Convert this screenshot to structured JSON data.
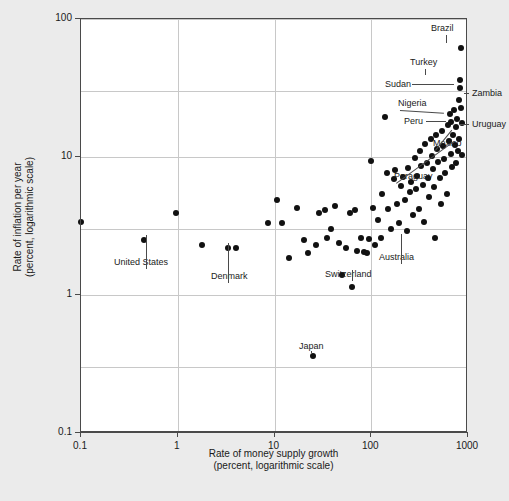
{
  "chart_data": {
    "type": "scatter",
    "title": "",
    "xlabel": "Rate of money supply growth\n(percent, logarithmic scale)",
    "xlabel_line1": "Rate of money supply growth",
    "xlabel_line2": "(percent, logarithmic scale)",
    "ylabel_line1": "Rate of inflation per year",
    "ylabel_line2": "(percent, logarithmic scale)",
    "xscale": "log",
    "yscale": "log",
    "xlim": [
      0.1,
      1000
    ],
    "ylim": [
      0.1,
      100
    ],
    "xticks": [
      "0.1",
      "1",
      "10",
      "100",
      "1000"
    ],
    "yticks": [
      "0.1",
      "1",
      "10",
      "100"
    ],
    "grid": true,
    "legend": "none",
    "marker_color": "#111111",
    "background_color": "#ebebeb",
    "plot_background_color": "#ffffff",
    "points": [
      {
        "x": 0.1,
        "y": 3.4
      },
      {
        "x": 0.45,
        "y": 2.5,
        "label": "United States"
      },
      {
        "x": 0.95,
        "y": 3.9
      },
      {
        "x": 1.8,
        "y": 2.3
      },
      {
        "x": 3.3,
        "y": 2.2
      },
      {
        "x": 4.0,
        "y": 2.2,
        "label": "Denmark"
      },
      {
        "x": 8.5,
        "y": 3.3
      },
      {
        "x": 10.5,
        "y": 4.9
      },
      {
        "x": 12.0,
        "y": 3.3
      },
      {
        "x": 14.0,
        "y": 1.85
      },
      {
        "x": 17.0,
        "y": 4.3
      },
      {
        "x": 20.0,
        "y": 2.5
      },
      {
        "x": 22.0,
        "y": 2.0
      },
      {
        "x": 25.0,
        "y": 0.36,
        "label": "Japan"
      },
      {
        "x": 27.0,
        "y": 2.3
      },
      {
        "x": 29.0,
        "y": 3.9
      },
      {
        "x": 33.0,
        "y": 4.1
      },
      {
        "x": 35.0,
        "y": 2.6
      },
      {
        "x": 38.0,
        "y": 3.0
      },
      {
        "x": 42.0,
        "y": 4.4
      },
      {
        "x": 46.0,
        "y": 2.4
      },
      {
        "x": 50.0,
        "y": 1.4,
        "label": "Switzerland"
      },
      {
        "x": 55.0,
        "y": 2.2
      },
      {
        "x": 60.0,
        "y": 3.9
      },
      {
        "x": 63.0,
        "y": 1.15
      },
      {
        "x": 68.0,
        "y": 4.1
      },
      {
        "x": 72.0,
        "y": 2.1
      },
      {
        "x": 78.0,
        "y": 2.6
      },
      {
        "x": 85.0,
        "y": 2.05
      },
      {
        "x": 90.0,
        "y": 2.0
      },
      {
        "x": 95.0,
        "y": 2.55,
        "label": "Australia"
      },
      {
        "x": 100.0,
        "y": 9.3
      },
      {
        "x": 105.0,
        "y": 4.3
      },
      {
        "x": 110.0,
        "y": 2.3
      },
      {
        "x": 118.0,
        "y": 3.5
      },
      {
        "x": 125.0,
        "y": 2.6
      },
      {
        "x": 130.0,
        "y": 5.4
      },
      {
        "x": 140.0,
        "y": 19.5
      },
      {
        "x": 145.0,
        "y": 7.6
      },
      {
        "x": 150.0,
        "y": 4.2
      },
      {
        "x": 160.0,
        "y": 3.0
      },
      {
        "x": 170.0,
        "y": 6.9
      },
      {
        "x": 175.0,
        "y": 8.0
      },
      {
        "x": 185.0,
        "y": 4.6
      },
      {
        "x": 195.0,
        "y": 3.3
      },
      {
        "x": 205.0,
        "y": 6.2
      },
      {
        "x": 215.0,
        "y": 7.2
      },
      {
        "x": 225.0,
        "y": 4.9
      },
      {
        "x": 235.0,
        "y": 2.9
      },
      {
        "x": 240.0,
        "y": 8.3
      },
      {
        "x": 250.0,
        "y": 5.6
      },
      {
        "x": 260.0,
        "y": 6.6
      },
      {
        "x": 270.0,
        "y": 3.8
      },
      {
        "x": 280.0,
        "y": 9.8
      },
      {
        "x": 290.0,
        "y": 5.9
      },
      {
        "x": 300.0,
        "y": 7.3
      },
      {
        "x": 310.0,
        "y": 4.2
      },
      {
        "x": 320.0,
        "y": 11.0
      },
      {
        "x": 330.0,
        "y": 8.6
      },
      {
        "x": 340.0,
        "y": 6.3
      },
      {
        "x": 350.0,
        "y": 3.4
      },
      {
        "x": 360.0,
        "y": 12.5
      },
      {
        "x": 375.0,
        "y": 9.1
      },
      {
        "x": 385.0,
        "y": 7.0
      },
      {
        "x": 395.0,
        "y": 5.1
      },
      {
        "x": 410.0,
        "y": 13.5
      },
      {
        "x": 420.0,
        "y": 10.2
      },
      {
        "x": 435.0,
        "y": 8.2
      },
      {
        "x": 445.0,
        "y": 6.1
      },
      {
        "x": 455.0,
        "y": 2.6
      },
      {
        "x": 470.0,
        "y": 14.5
      },
      {
        "x": 480.0,
        "y": 11.5
      },
      {
        "x": 495.0,
        "y": 9.2
      },
      {
        "x": 510.0,
        "y": 7.1
      },
      {
        "x": 520.0,
        "y": 4.6
      },
      {
        "x": 540.0,
        "y": 15.5
      },
      {
        "x": 555.0,
        "y": 12.0
      },
      {
        "x": 570.0,
        "y": 9.6
      },
      {
        "x": 585.0,
        "y": 7.6
      },
      {
        "x": 600.0,
        "y": 5.4
      },
      {
        "x": 615.0,
        "y": 17.0
      },
      {
        "x": 630.0,
        "y": 13.0
      },
      {
        "x": 645.0,
        "y": 20.5,
        "label": "Nigeria"
      },
      {
        "x": 660.0,
        "y": 10.5
      },
      {
        "x": 675.0,
        "y": 18.0,
        "label": "Peru"
      },
      {
        "x": 690.0,
        "y": 8.4
      },
      {
        "x": 700.0,
        "y": 14.5
      },
      {
        "x": 715.0,
        "y": 22.0
      },
      {
        "x": 730.0,
        "y": 12.2
      },
      {
        "x": 745.0,
        "y": 16.5,
        "label": "Mexico"
      },
      {
        "x": 760.0,
        "y": 9.0
      },
      {
        "x": 775.0,
        "y": 19.0,
        "label": "Uruguay"
      },
      {
        "x": 790.0,
        "y": 11.0
      },
      {
        "x": 800.0,
        "y": 13.5,
        "label": "Paraguay"
      },
      {
        "x": 810.0,
        "y": 26.0,
        "label": "Sudan"
      },
      {
        "x": 820.0,
        "y": 31.5
      },
      {
        "x": 830.0,
        "y": 36.0,
        "label": "Turkey"
      },
      {
        "x": 840.0,
        "y": 22.5,
        "label": "Zambia"
      },
      {
        "x": 855.0,
        "y": 62.0,
        "label": "Brazil"
      },
      {
        "x": 865.0,
        "y": 17.5
      },
      {
        "x": 875.0,
        "y": 10.3
      }
    ],
    "annotations": [
      {
        "label": "Brazil"
      },
      {
        "label": "Turkey"
      },
      {
        "label": "Sudan"
      },
      {
        "label": "Zambia"
      },
      {
        "label": "Nigeria"
      },
      {
        "label": "Peru"
      },
      {
        "label": "Uruguay"
      },
      {
        "label": "Mexico"
      },
      {
        "label": "Paraguay"
      },
      {
        "label": "United States"
      },
      {
        "label": "Denmark"
      },
      {
        "label": "Switzerland"
      },
      {
        "label": "Australia"
      },
      {
        "label": "Japan"
      }
    ]
  },
  "annotation_labels": {
    "brazil": "Brazil",
    "turkey": "Turkey",
    "sudan": "Sudan",
    "zambia": "Zambia",
    "nigeria": "Nigeria",
    "peru": "Peru",
    "uruguay": "Uruguay",
    "mexico": "Mexico",
    "paraguay": "Paraguay",
    "united_states": "United States",
    "denmark": "Denmark",
    "switzerland": "Switzerland",
    "australia": "Australia",
    "japan": "Japan"
  }
}
